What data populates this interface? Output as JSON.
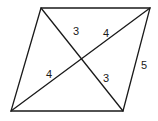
{
  "diagram": {
    "type": "parallelogram-with-diagonals",
    "vertices": {
      "top_left": [
        41,
        8
      ],
      "top_right": [
        150,
        8
      ],
      "bottom_right": [
        123,
        111
      ],
      "bottom_left": [
        11,
        111
      ]
    },
    "labels": [
      {
        "id": "upper-diag-segment-short",
        "text": "3",
        "x": 76,
        "y": 32
      },
      {
        "id": "upper-diag-segment-long",
        "text": "4",
        "x": 106,
        "y": 34
      },
      {
        "id": "lower-diag-segment-long",
        "text": "4",
        "x": 49,
        "y": 75
      },
      {
        "id": "lower-diag-segment-short",
        "text": "3",
        "x": 106,
        "y": 79
      },
      {
        "id": "right-side-length",
        "text": "5",
        "x": 144,
        "y": 66
      }
    ]
  }
}
